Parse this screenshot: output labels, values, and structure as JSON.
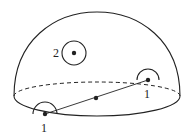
{
  "diagram": {
    "type": "hemisphere-with-points",
    "colors": {
      "stroke": "#222222",
      "background": "#ffffff"
    },
    "hemisphere": {
      "dome": {
        "left": [
          14,
          96
        ],
        "top": [
          97,
          12
        ],
        "right": [
          180,
          96
        ]
      },
      "equator": {
        "cx": 97,
        "cy": 96,
        "rx": 83,
        "ry": 14,
        "back_style": "dashed",
        "front_style": "solid"
      }
    },
    "points": [
      {
        "id": "interior-point",
        "label": "2",
        "x": 74,
        "y": 53,
        "ring_radius": 12,
        "label_x": 58,
        "label_y": 58
      },
      {
        "id": "boundary-point-right",
        "label": "1",
        "x": 148,
        "y": 80,
        "half_ring_radius": 11,
        "label_x": 144,
        "label_y": 98
      },
      {
        "id": "boundary-point-left",
        "label": "1",
        "x": 45,
        "y": 114,
        "half_ring_radius": 12,
        "label_x": 41,
        "label_y": 132
      },
      {
        "id": "midpoint",
        "label": "",
        "x": 96,
        "y": 98
      }
    ],
    "segment": {
      "from": "boundary-point-left",
      "to": "boundary-point-right"
    },
    "labels": {
      "interior": "2",
      "boundary_right": "1",
      "boundary_left": "1"
    }
  }
}
